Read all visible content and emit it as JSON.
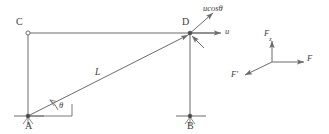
{
  "figure": {
    "kind": "mechanics-free-body-diagram",
    "stroke_color": "#6b6b6b",
    "label_color": "#3c3c3c",
    "width": 329,
    "height": 134,
    "linkage": {
      "points": [
        {
          "id": "C",
          "label": "C",
          "x": 28,
          "y": 33,
          "marker": "open-circle",
          "label_dx": -12,
          "label_dy": -16
        },
        {
          "id": "D",
          "label": "D",
          "x": 190,
          "y": 33,
          "marker": "filled-dot",
          "label_dx": -8,
          "label_dy": -16
        },
        {
          "id": "A",
          "label": "A",
          "x": 28,
          "y": 116,
          "marker": "filled-dot",
          "label_dx": -3,
          "label_dy": 5
        },
        {
          "id": "B",
          "label": "B",
          "x": 190,
          "y": 116,
          "marker": "filled-dot",
          "label_dx": -3,
          "label_dy": 5
        }
      ],
      "members": [
        {
          "name": "member-CD",
          "from": "C",
          "to": "D"
        },
        {
          "name": "member-CA",
          "from": "C",
          "to": "A"
        },
        {
          "name": "member-DB",
          "from": "D",
          "to": "B"
        },
        {
          "name": "member-AD-rod",
          "from": "A",
          "to": "D",
          "arrow_at": "D",
          "length_label": "L"
        }
      ],
      "angle": {
        "label": "θ",
        "at": "A",
        "between": [
          "horizontal-reference",
          "member-AD-rod"
        ],
        "label_x": 56,
        "label_y": 104
      }
    },
    "velocity_vectors": [
      {
        "name": "velocity-u",
        "label": "u",
        "direction": "right",
        "from_x": 190,
        "from_y": 33,
        "to_x": 222,
        "to_y": 33,
        "label_x": 226,
        "label_y": 29
      },
      {
        "name": "velocity-ucos-theta",
        "label": "ucosθ",
        "direction": "up-right",
        "from_x": 190,
        "from_y": 33,
        "to_x": 212,
        "to_y": 14,
        "label_x": 205,
        "label_y": 3
      },
      {
        "name": "velocity-component-into-D",
        "label": "",
        "direction": "down-right-into-point",
        "from_x": 203,
        "from_y": 47,
        "to_x": 192,
        "to_y": 36
      }
    ],
    "force_triad": {
      "name": "force-resolution-diagram",
      "origin_x": 272,
      "origin_y": 62,
      "vectors": [
        {
          "name": "force-F",
          "label": "F",
          "direction": "right",
          "to_x": 305,
          "to_y": 62,
          "label_x": 308,
          "label_y": 57
        },
        {
          "name": "force-Fz",
          "label": "F",
          "sub": "z",
          "direction": "up",
          "to_x": 272,
          "to_y": 40,
          "label_x": 264,
          "label_y": 29
        },
        {
          "name": "force-F-prime",
          "label": "F'",
          "direction": "down-left",
          "to_x": 244,
          "to_y": 76,
          "label_x": 232,
          "label_y": 72
        }
      ]
    },
    "ground_marks": [
      {
        "name": "ground-line-A",
        "x1": 14,
        "y1": 116,
        "x2": 44,
        "y2": 116
      },
      {
        "name": "ground-line-B",
        "x1": 176,
        "y1": 116,
        "x2": 206,
        "y2": 116
      },
      {
        "name": "hatch-A",
        "x": 28,
        "y": 116
      },
      {
        "name": "hatch-B",
        "x": 190,
        "y": 116
      }
    ],
    "angle_helper": {
      "name": "angle-reference-horizontal",
      "x1": 28,
      "y1": 116,
      "x2": 72,
      "y2": 116,
      "tick_x": 72,
      "tick_y1": 116,
      "tick_y2": 104
    }
  }
}
